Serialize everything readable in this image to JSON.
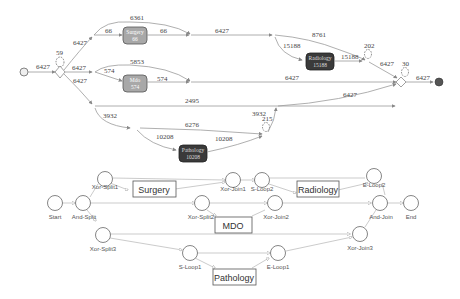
{
  "process_map": {
    "start_edge_label": "6427",
    "end_edge_label": "6427",
    "split_loop_count": "59",
    "join_loop_count": "30",
    "radiology_loop_count": "202",
    "pathology_loop_count": "215",
    "activities": [
      {
        "name": "Surgery",
        "count": "66",
        "style": "grey"
      },
      {
        "name": "Mdo",
        "count": "574",
        "style": "grey"
      },
      {
        "name": "Radiology",
        "count": "15188",
        "style": "dark"
      },
      {
        "name": "Pathology",
        "count": "10208",
        "style": "dark"
      }
    ],
    "edge_labels": {
      "split_to_surgery_branch": "6427",
      "split_to_mdo_branch": "6427",
      "split_to_lower_branch": "6427",
      "surgery_skip": "6361",
      "surgery_in": "66",
      "surgery_out": "66",
      "surgery_branch_out": "6427",
      "radiology_skip": "8761",
      "radiology_in": "15188",
      "radiology_out": "15188",
      "radiology_branch_out": "6427",
      "mdo_skip": "5853",
      "mdo_in": "574",
      "mdo_out": "574",
      "mdo_branch_out": "6427",
      "lower_skip": "2495",
      "lower_branch_out": "6427",
      "pathology_branch_in": "3932",
      "pathology_skip": "6276",
      "pathology_in": "10208",
      "pathology_out": "10208",
      "pathology_branch_out": "3932"
    }
  },
  "petri_net": {
    "places": [
      {
        "id": "start",
        "label": "Start"
      },
      {
        "id": "and_split",
        "label": "And-Split"
      },
      {
        "id": "xor_split1",
        "label": "Xor-Split1"
      },
      {
        "id": "xor_join1",
        "label": "Xor-Join1"
      },
      {
        "id": "s_loop2",
        "label": "S-Loop2"
      },
      {
        "id": "e_loop2",
        "label": "E-Loop2"
      },
      {
        "id": "and_join",
        "label": "And-Join"
      },
      {
        "id": "end",
        "label": "End"
      },
      {
        "id": "xor_split2",
        "label": "Xor-Split2"
      },
      {
        "id": "xor_join2",
        "label": "Xor-Join2"
      },
      {
        "id": "xor_split3",
        "label": "Xor-Split3"
      },
      {
        "id": "s_loop1",
        "label": "S-Loop1"
      },
      {
        "id": "e_loop1",
        "label": "E-Loop1"
      },
      {
        "id": "xor_join3",
        "label": "Xor-Join3"
      }
    ],
    "transitions": [
      {
        "id": "surgery",
        "label": "Surgery"
      },
      {
        "id": "radiology",
        "label": "Radiology"
      },
      {
        "id": "mdo",
        "label": "MDO"
      },
      {
        "id": "pathology",
        "label": "Pathology"
      }
    ]
  },
  "colors": {
    "edge": "#9a9a9a",
    "activity_grey": "#a8a8a8",
    "activity_dark": "#3a3a3a",
    "end_node": "#555555"
  }
}
